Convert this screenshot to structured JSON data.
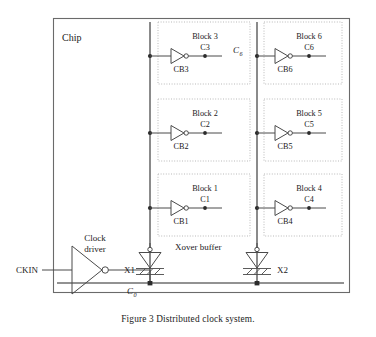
{
  "figure": {
    "caption": "Figure 3 Distributed clock system.",
    "chip_label": "Chip",
    "input_label": "CKIN",
    "root_net_label": "C",
    "root_net_sub": "0",
    "right_bus_label": "C",
    "right_bus_sub": "6",
    "driver_label_line1": "Clock",
    "driver_label_line2": "driver",
    "xover_label": "Xover buffer"
  },
  "colors": {
    "wire": "#4a4a4a",
    "bus": "#6e6e6e",
    "frame": "#6a6a6a",
    "block_border": "#b9b9b9",
    "dot": "#2b2b2b",
    "text": "#1a1a1a",
    "background": "#ffffff"
  },
  "xover_buffers": [
    {
      "id": "x1",
      "label": "X1"
    },
    {
      "id": "x2",
      "label": "X2"
    }
  ],
  "blocks": [
    {
      "id": "block3",
      "title": "Block 3",
      "clock_net": "C3",
      "buffer": "CB3",
      "column": "left",
      "row": "top"
    },
    {
      "id": "block2",
      "title": "Block 2",
      "clock_net": "C2",
      "buffer": "CB2",
      "column": "left",
      "row": "middle"
    },
    {
      "id": "block1",
      "title": "Block 1",
      "clock_net": "C1",
      "buffer": "CB1",
      "column": "left",
      "row": "bottom"
    },
    {
      "id": "block6",
      "title": "Block 6",
      "clock_net": "C6",
      "buffer": "CB6",
      "column": "right",
      "row": "top"
    },
    {
      "id": "block5",
      "title": "Block 5",
      "clock_net": "C5",
      "buffer": "CB5",
      "column": "right",
      "row": "middle"
    },
    {
      "id": "block4",
      "title": "Block 4",
      "clock_net": "C4",
      "buffer": "CB4",
      "column": "right",
      "row": "bottom"
    }
  ]
}
